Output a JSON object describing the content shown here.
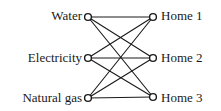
{
  "diagram": {
    "type": "bipartite-graph",
    "background_color": "#ffffff",
    "edge_color": "#1a1a1a",
    "node_stroke_color": "#1a1a1a",
    "node_fill_color": "#ffffff",
    "label_color": "#1a1a1a",
    "left_nodes": [
      {
        "id": "water",
        "label": "Water",
        "cx": 88,
        "cy": 17
      },
      {
        "id": "electricity",
        "label": "Electricity",
        "cx": 88,
        "cy": 58
      },
      {
        "id": "natural-gas",
        "label": "Natural gas",
        "cx": 88,
        "cy": 98
      }
    ],
    "right_nodes": [
      {
        "id": "home-1",
        "label": "Home 1",
        "cx": 153,
        "cy": 17
      },
      {
        "id": "home-2",
        "label": "Home 2",
        "cx": 153,
        "cy": 58
      },
      {
        "id": "home-3",
        "label": "Home 3",
        "cx": 153,
        "cy": 97
      }
    ],
    "edges": [
      {
        "id": "water-home-1",
        "from": "water",
        "to": "home-1",
        "x1": 88,
        "y1": 17,
        "x2": 153,
        "y2": 17
      },
      {
        "id": "water-home-2",
        "from": "water",
        "to": "home-2",
        "x1": 88,
        "y1": 17,
        "x2": 153,
        "y2": 58
      },
      {
        "id": "water-home-3",
        "from": "water",
        "to": "home-3",
        "x1": 88,
        "y1": 17,
        "x2": 153,
        "y2": 97
      },
      {
        "id": "electricity-home-1",
        "from": "electricity",
        "to": "home-1",
        "x1": 88,
        "y1": 58,
        "x2": 153,
        "y2": 17
      },
      {
        "id": "electricity-home-2",
        "from": "electricity",
        "to": "home-2",
        "x1": 88,
        "y1": 58,
        "x2": 153,
        "y2": 58
      },
      {
        "id": "electricity-home-3",
        "from": "electricity",
        "to": "home-3",
        "x1": 88,
        "y1": 58,
        "x2": 153,
        "y2": 97
      },
      {
        "id": "natural-gas-home-1",
        "from": "natural-gas",
        "to": "home-1",
        "x1": 88,
        "y1": 98,
        "x2": 153,
        "y2": 17
      },
      {
        "id": "natural-gas-home-2",
        "from": "natural-gas",
        "to": "home-2",
        "x1": 88,
        "y1": 98,
        "x2": 153,
        "y2": 58
      },
      {
        "id": "natural-gas-home-3",
        "from": "natural-gas",
        "to": "home-3",
        "x1": 88,
        "y1": 98,
        "x2": 153,
        "y2": 97
      }
    ],
    "node_radius": 3.4,
    "node_stroke_width": 1.4,
    "edge_stroke_width": 1.1
  }
}
